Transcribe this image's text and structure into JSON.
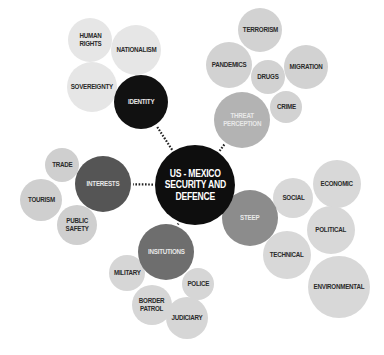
{
  "center": {
    "label": "US - MEXICO\nSECURITY AND\nDEFENCE",
    "x": 195,
    "y": 185,
    "r": 40,
    "color": "#0e0e0e"
  },
  "colors": {
    "leaf": "#d4d4d4",
    "leaf_light": "#e4e4e4",
    "connector": "#222222"
  },
  "categories": [
    {
      "id": "identity",
      "label": "IDENTITY",
      "x": 141,
      "y": 102,
      "r": 27,
      "color": "#111111",
      "children": [
        {
          "label": "HUMAN\nRIGHTS",
          "x": 90,
          "y": 40,
          "r": 22,
          "color": "#e6e6e6"
        },
        {
          "label": "NATIONALISM",
          "x": 136,
          "y": 50,
          "r": 25,
          "color": "#e6e6e6"
        },
        {
          "label": "SOVEREIGNTY",
          "x": 92,
          "y": 87,
          "r": 25,
          "color": "#e6e6e6"
        }
      ]
    },
    {
      "id": "threat-perception",
      "label": "THREAT\nPERCEPTION",
      "x": 242,
      "y": 120,
      "r": 28,
      "color": "#b3b3b3",
      "children": [
        {
          "label": "TERRORISM",
          "x": 260,
          "y": 30,
          "r": 22,
          "color": "#d2d2d2"
        },
        {
          "label": "PANDEMICS",
          "x": 229,
          "y": 65,
          "r": 23,
          "color": "#d2d2d2"
        },
        {
          "label": "DRUGS",
          "x": 268,
          "y": 77,
          "r": 17,
          "color": "#d2d2d2"
        },
        {
          "label": "MIGRATION",
          "x": 306,
          "y": 67,
          "r": 22,
          "color": "#d2d2d2"
        },
        {
          "label": "CRIME",
          "x": 286,
          "y": 107,
          "r": 16,
          "color": "#d2d2d2"
        }
      ]
    },
    {
      "id": "interests",
      "label": "INTERESTS",
      "x": 103,
      "y": 184,
      "r": 28,
      "color": "#555555",
      "children": [
        {
          "label": "TRADE",
          "x": 62,
          "y": 165,
          "r": 17,
          "color": "#cfcfcf"
        },
        {
          "label": "TOURISM",
          "x": 41,
          "y": 200,
          "r": 21,
          "color": "#cfcfcf"
        },
        {
          "label": "PUBLIC\nSAFETY",
          "x": 77,
          "y": 225,
          "r": 20,
          "color": "#cfcfcf"
        }
      ]
    },
    {
      "id": "institutions",
      "label": "INSITUTIONS",
      "x": 166,
      "y": 252,
      "r": 28,
      "color": "#6e6e6e",
      "children": [
        {
          "label": "MILITARY",
          "x": 127,
          "y": 273,
          "r": 18,
          "color": "#d6d6d6"
        },
        {
          "label": "BORDER\nPATROL",
          "x": 152,
          "y": 305,
          "r": 20,
          "color": "#d6d6d6"
        },
        {
          "label": "POLICE",
          "x": 198,
          "y": 284,
          "r": 16,
          "color": "#d6d6d6"
        },
        {
          "label": "JUDICIARY",
          "x": 187,
          "y": 318,
          "r": 21,
          "color": "#d6d6d6"
        }
      ]
    },
    {
      "id": "steep",
      "label": "STEEP",
      "x": 250,
      "y": 218,
      "r": 28,
      "color": "#8c8c8c",
      "children": [
        {
          "label": "SOCIAL",
          "x": 293,
          "y": 198,
          "r": 20,
          "color": "#d8d8d8"
        },
        {
          "label": "ECONOMIC",
          "x": 337,
          "y": 184,
          "r": 24,
          "color": "#d8d8d8"
        },
        {
          "label": "POLITICAL",
          "x": 331,
          "y": 230,
          "r": 24,
          "color": "#d8d8d8"
        },
        {
          "label": "TECHNICAL",
          "x": 287,
          "y": 255,
          "r": 24,
          "color": "#d8d8d8"
        },
        {
          "label": "ENVIRONMENTAL",
          "x": 339,
          "y": 287,
          "r": 31,
          "color": "#d8d8d8"
        }
      ]
    }
  ]
}
